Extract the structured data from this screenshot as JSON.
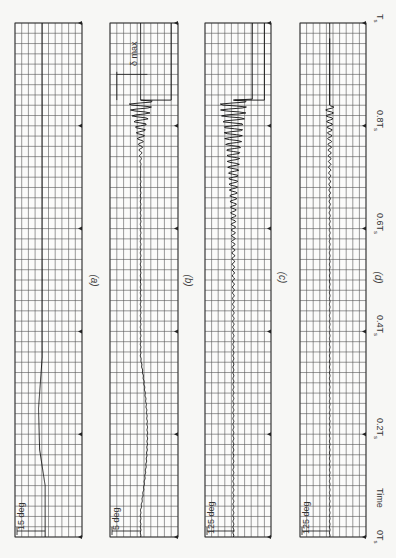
{
  "chart_data": [
    {
      "type": "line",
      "panel": "(a)",
      "scale_label": "15 deg",
      "orientation": "time axis vertical, increasing upward",
      "xlabel": "Time",
      "x_ticks": [
        "0T_s",
        "0.2T_s",
        "0.4T_s",
        "0.6T_s",
        "0.8T_s",
        "T_s"
      ],
      "description": "Smooth single excursion of approx. 0.8 deg-scale divisions near 0.1T_s, then flat; tiny ripple near 0.83T_s",
      "x": [
        0,
        0.1,
        0.17,
        0.25,
        0.35,
        0.6,
        0.83,
        1.0
      ],
      "values": [
        0,
        0,
        -1.5,
        -1.8,
        -0.8,
        -0.8,
        -0.8,
        -0.8
      ]
    },
    {
      "type": "line",
      "panel": "(b)",
      "scale_label": "5 deg",
      "annotation": "δ max",
      "orientation": "time axis vertical, increasing upward",
      "x_ticks": [
        "0T_s",
        "0.2T_s",
        "0.4T_s",
        "0.6T_s",
        "0.8T_s",
        "T_s"
      ],
      "description": "Slow excursion near 0.2T_s, low-amplitude oscillation growing into large divergent oscillation at ~0.8–0.85T_s, then flat step to δ max",
      "x": [
        0,
        0.05,
        0.2,
        0.3,
        0.5,
        0.7,
        0.8,
        0.84,
        0.85,
        1.0
      ],
      "values": [
        0,
        0,
        2.4,
        0.5,
        0,
        0,
        2.5,
        5.5,
        0,
        0
      ],
      "envelope_peak": 5.5
    },
    {
      "type": "line",
      "panel": "(c)",
      "scale_label": "125 deg",
      "orientation": "time axis vertical, increasing upward",
      "x_ticks": [
        "0T_s",
        "0.2T_s",
        "0.4T_s",
        "0.6T_s",
        "0.8T_s",
        "T_s"
      ],
      "description": "Persistent small oscillation growing into large divergent oscillation at ~0.8–0.84T_s, followed by a step",
      "x": [
        0,
        0.5,
        0.7,
        0.8,
        0.84,
        0.85,
        1.0
      ],
      "values": [
        0,
        0.3,
        0.8,
        3.0,
        6.5,
        8.5,
        8.5
      ],
      "envelope_peak": 6.5
    },
    {
      "type": "line",
      "panel": "(d)",
      "scale_label": "125 deg",
      "orientation": "time axis vertical, increasing upward",
      "x_ticks": [
        "0T_s",
        "0.2T_s",
        "0.4T_s",
        "0.6T_s",
        "0.8T_s",
        "T_s"
      ],
      "description": "Very small oscillation through the run, small oscillation burst near 0.8–0.84T_s then flat",
      "x": [
        0,
        0.5,
        0.75,
        0.83,
        0.84,
        1.0
      ],
      "values": [
        0,
        0.1,
        0.4,
        1.2,
        0,
        0
      ],
      "envelope_peak": 1.2
    }
  ],
  "panels": [
    {
      "id": "a",
      "label": "(a)",
      "scale": "15 deg"
    },
    {
      "id": "b",
      "label": "(b)",
      "scale": "5 deg",
      "annotation": "δ max"
    },
    {
      "id": "c",
      "label": "(c)",
      "scale": "125 deg"
    },
    {
      "id": "d",
      "label": "(d)",
      "scale": "125 deg"
    }
  ],
  "time_axis": {
    "title": "Time",
    "ticks": [
      {
        "label": "0T",
        "sub": "s"
      },
      {
        "label": "0.2T",
        "sub": "s"
      },
      {
        "label": "0.4T",
        "sub": "s"
      },
      {
        "label": "0.6T",
        "sub": "s"
      },
      {
        "label": "0.8T",
        "sub": "s"
      },
      {
        "label": "T",
        "sub": "s"
      }
    ]
  }
}
